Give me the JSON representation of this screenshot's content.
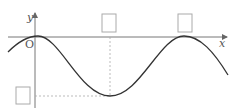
{
  "diagram": {
    "type": "sine-graph",
    "labels": {
      "y_axis": "y",
      "x_axis": "x",
      "origin": "O"
    },
    "answer_boxes": [
      {
        "id": "box-1",
        "position": "x of minimum point (on x-axis)"
      },
      {
        "id": "box-2",
        "position": "x of second maximum (on x-axis)"
      },
      {
        "id": "box-3",
        "position": "y of minimum (on y-axis)"
      }
    ],
    "colors": {
      "axis": "#666666",
      "curve": "#333333",
      "dashed": "#999999",
      "box": "#aaaaaa"
    }
  }
}
